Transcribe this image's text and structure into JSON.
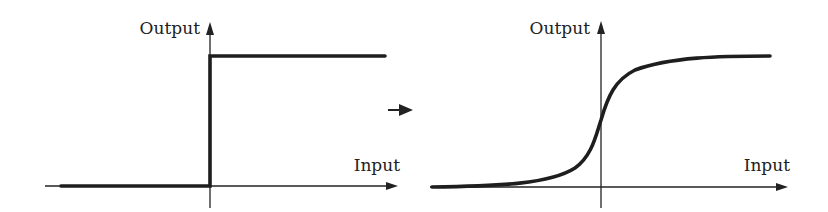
{
  "panels": [
    {
      "id": "step",
      "y_label": "Output",
      "x_label": "Input",
      "description": "step function"
    },
    {
      "id": "sigmoid",
      "y_label": "Output",
      "x_label": "Input",
      "description": "sigmoid function"
    }
  ],
  "transition_arrow": "→",
  "colors": {
    "line": "#1e1e1e",
    "background": "#ffffff"
  }
}
